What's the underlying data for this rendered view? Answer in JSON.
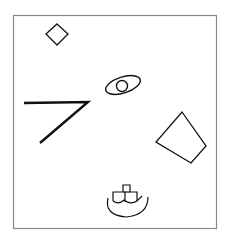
{
  "figure": {
    "background": "#ffffff",
    "frame": {
      "x": 13,
      "y": 15,
      "width": 203,
      "height": 213,
      "stroke": "#888888"
    },
    "shapes": [
      {
        "id": "diamond",
        "label": "small diamond"
      },
      {
        "id": "eye",
        "label": "ellipse with inner circle"
      },
      {
        "id": "angle-line",
        "label": "thick angled line (7 shape)"
      },
      {
        "id": "quadrilateral",
        "label": "tilted quadrilateral"
      },
      {
        "id": "boat",
        "label": "boat with cross-shaped cabin"
      }
    ],
    "stroke_color": "#111111"
  }
}
